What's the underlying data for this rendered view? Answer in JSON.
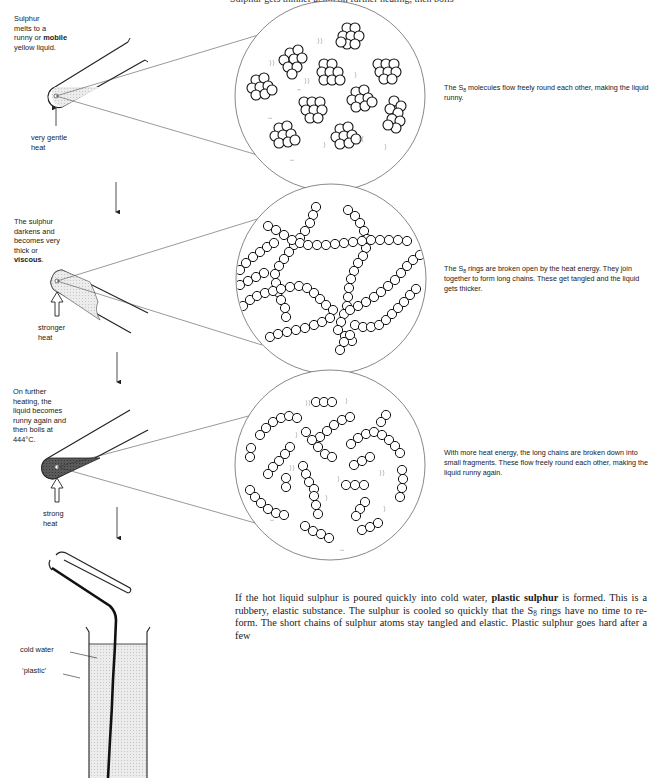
{
  "header": {
    "cut_off_title": "Sulphur gets thinner again on further heating, then boils"
  },
  "stages": [
    {
      "id": "melting",
      "side_label": {
        "lines": [
          "Sulphur",
          "melts to a",
          "runny or "
        ],
        "bold_word": "mobile",
        "after_bold": "yellow liquid."
      },
      "heat_label": [
        "very gentle",
        "heat"
      ],
      "description_prefix": "The S",
      "description_sub": "8",
      "description_suffix": " molecules flow freely round each other, making the liquid runny.",
      "liquid_color": "#e6e6e6",
      "molecule_type": "S8 rings"
    },
    {
      "id": "viscous",
      "side_label": {
        "lines": [
          "The sulphur",
          "darkens and",
          "becomes very",
          "thick or"
        ],
        "bold_word": "viscous",
        "after_bold": "."
      },
      "heat_label": [
        "stronger",
        "heat"
      ],
      "description_prefix": "The S",
      "description_sub": "8",
      "description_suffix": " rings are broken open by the heat energy. They join together to form long chains. These get tangled and the liquid gets thicker.",
      "liquid_color": "#d9d9d9",
      "molecule_type": "long chains"
    },
    {
      "id": "boiling",
      "side_label": {
        "lines": [
          "On further",
          "heating, the",
          "liquid becomes",
          "runny again and",
          "then boils at",
          "444°C."
        ],
        "bold_word": "",
        "after_bold": ""
      },
      "heat_label": [
        "strong",
        "heat"
      ],
      "description_prefix": "",
      "description_sub": "",
      "description_suffix": "With more heat energy, the long chains are broken down into small fragments. These flow freely round each other, making the liquid runny again.",
      "liquid_color": "#555555",
      "molecule_type": "short fragments"
    }
  ],
  "beaker": {
    "labels": [
      "cold water",
      "‘plastic’"
    ]
  },
  "paragraph": {
    "part1": "If the hot liquid sulphur is poured quickly into cold water, ",
    "bold": "plastic sulphur",
    "part2": " is formed. This is a rubbery, elastic substance. The sulphur is cooled so quickly that the S",
    "sub": "8",
    "part3": " rings have no time to re-form. The short chains of sulphur atoms stay tangled and elastic. Plastic sulphur goes hard after a few"
  },
  "colors": {
    "ink": "#1a1a1a",
    "tube_fill_light": "#e6e6e6",
    "tube_fill_dark": "#555555",
    "water_fill": "#e8e8e8"
  }
}
